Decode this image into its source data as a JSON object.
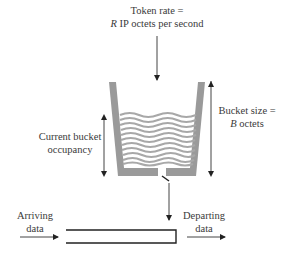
{
  "diagram": {
    "type": "token-bucket",
    "token_rate": {
      "line1": "Token rate =",
      "line2_var": "R",
      "line2_rest": " IP octets per second"
    },
    "bucket_size": {
      "line1": "Bucket size =",
      "line2_var": "B",
      "line2_rest": " octets"
    },
    "occupancy": {
      "line1": "Current bucket",
      "line2": "occupancy"
    },
    "arriving": {
      "line1": "Arriving",
      "line2": "data"
    },
    "departing": {
      "line1": "Departing",
      "line2": "data"
    },
    "colors": {
      "bucket_wall": "#9a9a9a",
      "water_line": "#a8a8a8",
      "arrow": "#222222",
      "text": "#3a3a3a"
    }
  }
}
